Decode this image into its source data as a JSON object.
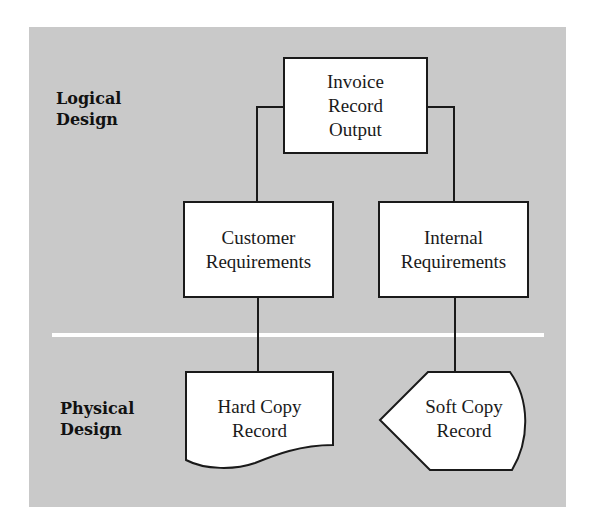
{
  "colors": {
    "background": "#ffffff",
    "panel": "#c9c9c9",
    "divider": "#ffffff",
    "node_fill": "#ffffff",
    "stroke": "#1a1a1a"
  },
  "sections": {
    "logical": {
      "line1": "Logical",
      "line2": "Design"
    },
    "physical": {
      "line1": "Physical",
      "line2": "Design"
    }
  },
  "nodes": {
    "invoice": {
      "shape": "process",
      "line1": "Invoice",
      "line2": "Record",
      "line3": "Output"
    },
    "customer": {
      "shape": "process",
      "line1": "Customer",
      "line2": "Requirements"
    },
    "internal": {
      "shape": "process",
      "line1": "Internal",
      "line2": "Requirements"
    },
    "hard_copy": {
      "shape": "document",
      "line1": "Hard Copy",
      "line2": "Record"
    },
    "soft_copy": {
      "shape": "display",
      "line1": "Soft Copy",
      "line2": "Record"
    }
  },
  "edges": [
    {
      "from": "invoice",
      "to": "customer"
    },
    {
      "from": "invoice",
      "to": "internal"
    },
    {
      "from": "customer",
      "to": "hard_copy"
    },
    {
      "from": "internal",
      "to": "soft_copy"
    }
  ]
}
